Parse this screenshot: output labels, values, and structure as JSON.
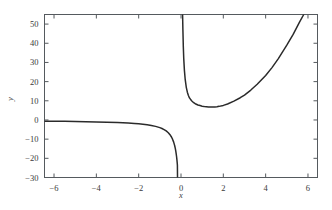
{
  "chart_data": {
    "type": "line",
    "title": "",
    "xlabel": "x",
    "ylabel": "y",
    "xlim": [
      -6.45,
      6.45
    ],
    "ylim": [
      -30,
      55
    ],
    "grid": false,
    "legend": null,
    "xticks": [
      -6,
      -4,
      -2,
      0,
      2,
      4,
      6
    ],
    "xticklabels": [
      "−6",
      "−4",
      "−2",
      "0",
      "2",
      "4",
      "6"
    ],
    "yticks": [
      -30,
      -20,
      -10,
      0,
      10,
      20,
      30,
      40,
      50
    ],
    "yticklabels": [
      "−30",
      "−20",
      "−10",
      "0",
      "10",
      "20",
      "30",
      "40",
      "50"
    ],
    "series": [
      {
        "name": "branch-left",
        "comment": "x < 0 branch, approaches y=0 from below for large negative x, diverges to -infinity as x -> 0 minus",
        "x": [
          -6.45,
          -6.0,
          -5.5,
          -5.0,
          -4.5,
          -4.0,
          -3.5,
          -3.0,
          -2.5,
          -2.2,
          -2.0,
          -1.8,
          -1.6,
          -1.4,
          -1.2,
          -1.0,
          -0.9,
          -0.8,
          -0.7,
          -0.6,
          -0.5,
          -0.45,
          -0.4,
          -0.35,
          -0.3,
          -0.27,
          -0.25,
          -0.23,
          -0.21,
          -0.2,
          -0.19,
          -0.18,
          -0.17,
          -0.165
        ],
        "y": [
          -0.62,
          -0.67,
          -0.73,
          -0.8,
          -0.89,
          -1.0,
          -1.14,
          -1.33,
          -1.6,
          -1.82,
          -2.0,
          -2.22,
          -2.5,
          -2.86,
          -3.33,
          -4.0,
          -4.44,
          -5.0,
          -5.71,
          -6.67,
          -8.0,
          -8.89,
          -10.0,
          -11.43,
          -13.33,
          -14.81,
          -16.0,
          -17.39,
          -19.05,
          -20.0,
          -21.05,
          -22.22,
          -23.53,
          -30.0
        ]
      },
      {
        "name": "branch-right",
        "comment": "x > 0 branch, diverges to +infinity as x -> 0 plus, minimum near x = 1.6 at y = 5, rises again, exits top near x = 5.8",
        "x": [
          0.075,
          0.09,
          0.11,
          0.13,
          0.16,
          0.2,
          0.25,
          0.3,
          0.35,
          0.4,
          0.5,
          0.6,
          0.7,
          0.8,
          0.9,
          1.0,
          1.1,
          1.2,
          1.3,
          1.4,
          1.5,
          1.6,
          1.7,
          1.8,
          2.0,
          2.2,
          2.5,
          2.8,
          3.0,
          3.3,
          3.6,
          4.0,
          4.3,
          4.6,
          5.0,
          5.3,
          5.6,
          5.8
        ],
        "y": [
          55.0,
          47.0,
          38.0,
          32.0,
          26.0,
          21.0,
          17.0,
          14.5,
          12.8,
          11.5,
          10.0,
          9.0,
          8.3,
          7.8,
          7.5,
          7.2,
          7.0,
          6.9,
          6.8,
          6.75,
          6.75,
          6.8,
          6.9,
          7.1,
          7.6,
          8.3,
          9.8,
          11.6,
          13.0,
          15.6,
          18.6,
          23.2,
          27.3,
          32.0,
          39.0,
          44.6,
          51.0,
          55.0
        ]
      }
    ]
  },
  "axes": {
    "ylabel_text": "y",
    "xlabel_text": "x"
  },
  "colors": {
    "curve": "#2b2b2b",
    "frame": "#555a5e",
    "text": "#3a3a3a",
    "background": "#ffffff"
  }
}
